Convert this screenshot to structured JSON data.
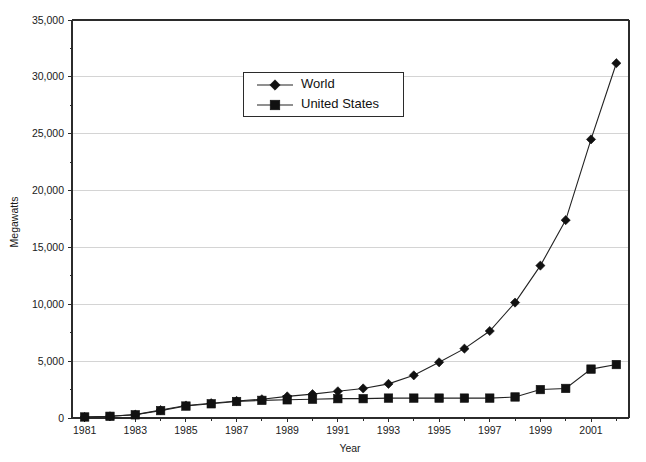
{
  "chart_data": {
    "type": "line",
    "title": "",
    "xlabel": "Year",
    "ylabel": "Megawatts",
    "xlim": [
      1980.5,
      2002.5
    ],
    "ylim": [
      0,
      35000
    ],
    "grid": true,
    "legend_position": "top-center",
    "x": [
      1981,
      1982,
      1983,
      1984,
      1985,
      1986,
      1987,
      1988,
      1989,
      1990,
      1991,
      1992,
      1993,
      1994,
      1995,
      1996,
      1997,
      1998,
      1999,
      2000,
      2001,
      2002
    ],
    "x_tick_labels": [
      "1981",
      "1983",
      "1985",
      "1987",
      "1989",
      "1991",
      "1993",
      "1995",
      "1997",
      "1999",
      "2001"
    ],
    "x_tick_values": [
      1981,
      1983,
      1985,
      1987,
      1989,
      1991,
      1993,
      1995,
      1997,
      1999,
      2001
    ],
    "y_tick_labels": [
      "0",
      "5,000",
      "10,000",
      "15,000",
      "20,000",
      "25,000",
      "30,000",
      "35,000"
    ],
    "y_tick_values": [
      0,
      5000,
      10000,
      15000,
      20000,
      25000,
      30000,
      35000
    ],
    "series": [
      {
        "name": "World",
        "marker": "diamond",
        "color": "#111111",
        "values": [
          90,
          150,
          300,
          700,
          1100,
          1300,
          1500,
          1650,
          1900,
          2100,
          2350,
          2600,
          3000,
          3750,
          4900,
          6100,
          7650,
          10150,
          13400,
          17400,
          24500,
          31200
        ]
      },
      {
        "name": "United States",
        "marker": "square",
        "color": "#111111",
        "values": [
          90,
          150,
          280,
          650,
          1050,
          1250,
          1450,
          1550,
          1600,
          1650,
          1700,
          1700,
          1750,
          1750,
          1750,
          1750,
          1750,
          1850,
          2500,
          2600,
          4300,
          4700
        ]
      }
    ]
  },
  "legend": {
    "entries": [
      {
        "label": "World"
      },
      {
        "label": "United States"
      }
    ]
  },
  "axes": {
    "x_title": "Year",
    "y_title": "Megawatts"
  }
}
